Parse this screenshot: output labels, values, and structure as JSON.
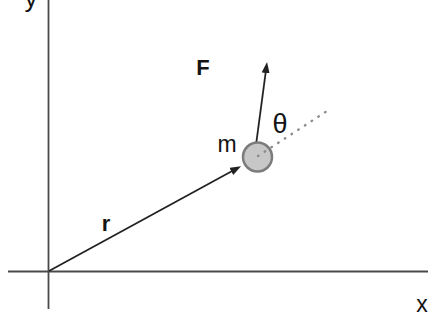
{
  "figure": {
    "labels": {
      "y_axis": "y",
      "x_axis": "x",
      "force": "F",
      "angle": "θ",
      "mass": "m",
      "position": "r"
    },
    "colors": {
      "background": "#ffffff",
      "axis": "#4a4a4a",
      "vector": "#222222",
      "dotted_line": "#8c8c8c",
      "mass_fill": "#c7c7c7",
      "mass_border": "#7c7c7c",
      "label_text": "#141414"
    }
  }
}
